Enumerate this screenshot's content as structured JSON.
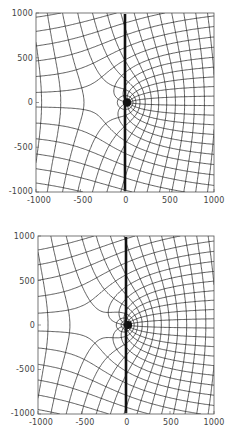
{
  "chart_data": [
    {
      "type": "contour",
      "title": "",
      "xlabel": "",
      "ylabel": "",
      "xlim": [
        -1000,
        1000
      ],
      "ylim": [
        -1000,
        1000
      ],
      "x_ticks": [
        "-1000",
        "-500",
        "0",
        "500",
        "1000"
      ],
      "y_ticks": [
        "1000",
        "500",
        "0",
        "-500",
        "-1000"
      ],
      "grid": false,
      "description": "Orthogonal field/equipotential line grid; thick vertical line at x=0 from y=-1000 to 1000; dense singular cluster near origin on right side; saddle-like curves near x=-400, y=0 on left side",
      "annotations": [
        "thick vertical line at x = 0"
      ]
    },
    {
      "type": "contour",
      "title": "",
      "xlabel": "",
      "ylabel": "",
      "xlim": [
        -1000,
        1000
      ],
      "ylim": [
        -1000,
        1000
      ],
      "x_ticks": [
        "-1000",
        "-500",
        "0",
        "500",
        "1000"
      ],
      "y_ticks": [
        "1000",
        "500",
        "0",
        "-500",
        "-1000"
      ],
      "grid": false,
      "description": "Orthogonal field/equipotential line grid; thick vertical line at x=0; dense singular cluster at origin; left side with rounded closed curves near origin",
      "annotations": [
        "thick vertical line at x = 0"
      ]
    }
  ],
  "panels": [
    {
      "x_ticks": [
        "-1000",
        "-500",
        "0",
        "500",
        "1000"
      ],
      "y_ticks": [
        "1000",
        "500",
        "0",
        "-500",
        "-1000"
      ]
    },
    {
      "x_ticks": [
        "-1000",
        "-500",
        "0",
        "500",
        "1000"
      ],
      "y_ticks": [
        "1000",
        "500",
        "0",
        "-500",
        "-1000"
      ]
    }
  ],
  "caption_fragment": "",
  "colors": {
    "line": "#1a1a1a",
    "frame": "#555555",
    "background": "#ffffff"
  }
}
